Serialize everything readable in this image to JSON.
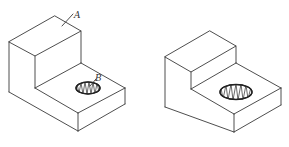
{
  "figures": [
    {
      "id": "left",
      "description": "Isometric view of L-shaped block with threaded hole, labeled",
      "labels": {
        "top_face": "A",
        "hole": "B"
      }
    },
    {
      "id": "right",
      "description": "Isometric view of L-shaped block with threaded hole, unlabeled"
    }
  ],
  "colors": {
    "line": "#3a3a3a",
    "background": "#ffffff"
  }
}
